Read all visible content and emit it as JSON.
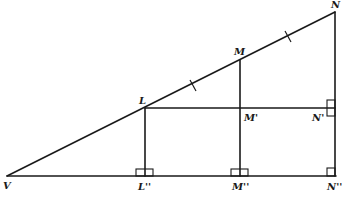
{
  "diagram": {
    "type": "geometry",
    "stroke_color": "#1a1a1a",
    "background": "#ffffff",
    "points": {
      "V": {
        "label": "V",
        "x": 7,
        "y": 176
      },
      "L": {
        "label": "L",
        "x": 145,
        "y": 108
      },
      "M": {
        "label": "M",
        "x": 240,
        "y": 60
      },
      "N": {
        "label": "N",
        "x": 335,
        "y": 12
      },
      "M1": {
        "label": "M'",
        "x": 240,
        "y": 108
      },
      "N1": {
        "label": "N'",
        "x": 335,
        "y": 108
      },
      "L2": {
        "label": "L''",
        "x": 145,
        "y": 176
      },
      "M2": {
        "label": "M''",
        "x": 240,
        "y": 176
      },
      "N2": {
        "label": "N''",
        "x": 335,
        "y": 176
      }
    },
    "segments": [
      {
        "from": "V",
        "to": "N"
      },
      {
        "from": "V",
        "to": "N2"
      },
      {
        "from": "N",
        "to": "N2"
      },
      {
        "from": "L",
        "to": "L2"
      },
      {
        "from": "M",
        "to": "M2"
      },
      {
        "from": "L",
        "to": "N1"
      }
    ],
    "congruence_ticks": [
      {
        "segment": "LM",
        "count": 1
      },
      {
        "segment": "MN",
        "count": 1
      }
    ],
    "right_angles": [
      "L''",
      "M''",
      "N''",
      "N'"
    ]
  },
  "labels": {
    "V": "V",
    "L": "L",
    "M": "M",
    "N": "N",
    "M1": "M'",
    "N1": "N'",
    "L2": "L''",
    "M2": "M''",
    "N2": "N''"
  }
}
